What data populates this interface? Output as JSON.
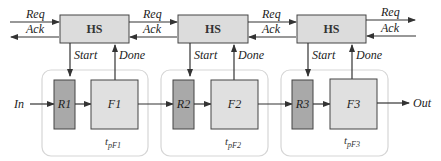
{
  "diagram": {
    "type": "asynchronous-pipeline-handshake",
    "colors": {
      "hs_fill": "#dcdcdc",
      "register_fill": "#a9a9a9",
      "function_fill": "#e0e0e0",
      "stage_border": "#d6d6d6",
      "line": "#333333"
    },
    "handshake_blocks": [
      {
        "label": "HS"
      },
      {
        "label": "HS"
      },
      {
        "label": "HS"
      }
    ],
    "handshake_signals": [
      {
        "req": "Req",
        "ack": "Ack"
      },
      {
        "req": "Req",
        "ack": "Ack"
      },
      {
        "req": "Req",
        "ack": "Ack"
      },
      {
        "req": "Req",
        "ack": "Ack"
      }
    ],
    "control_signals": [
      {
        "start": "Start",
        "done": "Done"
      },
      {
        "start": "Start",
        "done": "Done"
      },
      {
        "start": "Start",
        "done": "Done"
      }
    ],
    "stages": [
      {
        "register": "R1",
        "function": "F1",
        "delay": "t",
        "delay_sub": "pF1"
      },
      {
        "register": "R2",
        "function": "F2",
        "delay": "t",
        "delay_sub": "pF2"
      },
      {
        "register": "R3",
        "function": "F3",
        "delay": "t",
        "delay_sub": "pF3"
      }
    ],
    "input_label": "In",
    "output_label": "Out"
  }
}
